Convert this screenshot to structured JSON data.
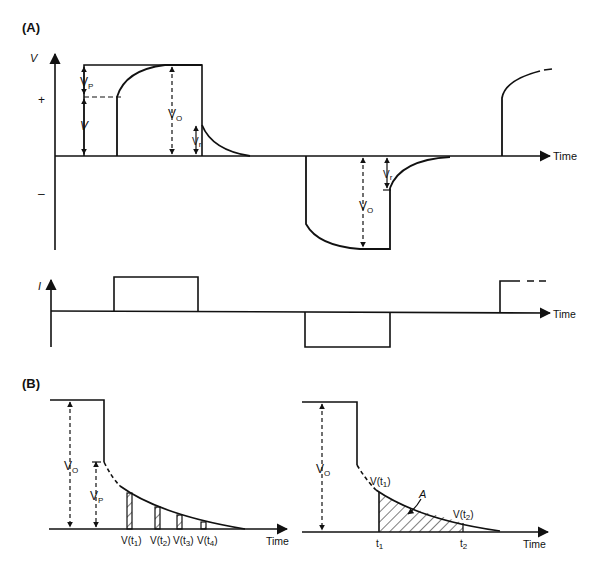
{
  "panels": {
    "A": {
      "label": "(A)",
      "voltage_plot": {
        "y_axis_label": "V",
        "plus_sign": "+",
        "minus_sign": "–",
        "x_axis_label": "Time",
        "annotations": {
          "vp": "V",
          "vp_sub": "P",
          "v": "V",
          "vo": "V",
          "vo_sub": "O",
          "vr": "V",
          "vr_sub": "r",
          "vo_neg": "V",
          "vo_neg_sub": "O",
          "vr_neg": "V",
          "vr_neg_sub": "r"
        }
      },
      "current_plot": {
        "y_axis_label": "I",
        "x_axis_label": "Time"
      }
    },
    "B": {
      "label": "(B)",
      "left_plot": {
        "x_axis_label": "Time",
        "vo": "V",
        "vo_sub": "O",
        "vp": "V",
        "vp_sub": "P",
        "samples": [
          {
            "label": "V(t",
            "sub": "1",
            "close": ")"
          },
          {
            "label": "V(t",
            "sub": "2",
            "close": ")"
          },
          {
            "label": "V(t",
            "sub": "3",
            "close": ")"
          },
          {
            "label": "V(t",
            "sub": "4",
            "close": ")"
          }
        ]
      },
      "right_plot": {
        "x_axis_label": "Time",
        "vo": "V",
        "vo_sub": "O",
        "vt1": "V(t",
        "vt1_sub": "1",
        "vt2": "V(t",
        "vt2_sub": "2",
        "area_label": "A",
        "t1": "t",
        "t1_sub": "1",
        "t2": "t",
        "t2_sub": "2"
      }
    }
  }
}
